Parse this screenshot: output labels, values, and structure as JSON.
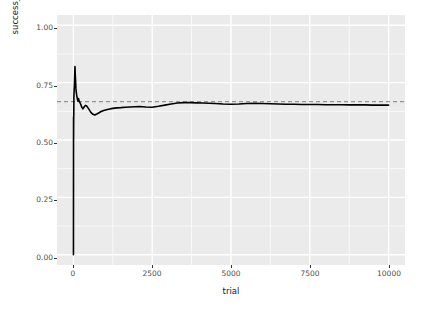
{
  "chart_data": {
    "type": "line",
    "title": "",
    "subtitle": "",
    "xlabel": "trial",
    "ylabel": "success_rate",
    "xlim": [
      -520,
      10520
    ],
    "ylim": [
      -0.045,
      1.045
    ],
    "grid": true,
    "grid_color": "#ffffff",
    "panel_background": "#ebebeb",
    "legend": null,
    "legend_position": "none",
    "xticks": [
      0,
      2500,
      5000,
      7500,
      10000
    ],
    "xtick_labels": [
      "0",
      "2500",
      "5000",
      "7500",
      "10000"
    ],
    "xticks_minor": [
      1250,
      3750,
      6250,
      8750
    ],
    "yticks": [
      0.0,
      0.25,
      0.5,
      0.75,
      1.0
    ],
    "ytick_labels": [
      "0.00",
      "0.25",
      "0.50",
      "0.75",
      "1.00"
    ],
    "yticks_minor": [
      0.125,
      0.375,
      0.625,
      0.875
    ],
    "series": [
      {
        "name": "success_rate",
        "type": "line",
        "color": "#000000",
        "linewidth": 1.6,
        "linestyle": "solid",
        "x": [
          1,
          2,
          3,
          4,
          5,
          6,
          8,
          10,
          13,
          16,
          20,
          25,
          30,
          36,
          43,
          50,
          60,
          70,
          80,
          90,
          100,
          115,
          130,
          145,
          160,
          180,
          200,
          225,
          250,
          275,
          300,
          340,
          380,
          420,
          470,
          520,
          570,
          620,
          680,
          740,
          800,
          880,
          960,
          1050,
          1150,
          1250,
          1380,
          1500,
          1650,
          1800,
          1950,
          2100,
          2300,
          2500,
          2700,
          2900,
          3100,
          3300,
          3500,
          3700,
          3900,
          4100,
          4300,
          4500,
          4750,
          5000,
          5250,
          5500,
          5750,
          6000,
          6250,
          6500,
          6750,
          7000,
          7250,
          7500,
          7750,
          8000,
          8250,
          8500,
          8750,
          9000,
          9250,
          9500,
          9750,
          10000
        ],
        "y": [
          0.0,
          0.0,
          0.333,
          0.5,
          0.6,
          0.5,
          0.571,
          0.6,
          0.615,
          0.688,
          0.7,
          0.72,
          0.733,
          0.75,
          0.791,
          0.82,
          0.783,
          0.757,
          0.725,
          0.711,
          0.7,
          0.687,
          0.677,
          0.669,
          0.681,
          0.672,
          0.665,
          0.658,
          0.649,
          0.641,
          0.636,
          0.644,
          0.651,
          0.648,
          0.639,
          0.628,
          0.618,
          0.612,
          0.609,
          0.613,
          0.618,
          0.624,
          0.629,
          0.632,
          0.635,
          0.638,
          0.64,
          0.641,
          0.643,
          0.644,
          0.645,
          0.646,
          0.644,
          0.643,
          0.647,
          0.652,
          0.657,
          0.661,
          0.663,
          0.663,
          0.662,
          0.661,
          0.66,
          0.659,
          0.657,
          0.656,
          0.657,
          0.659,
          0.66,
          0.659,
          0.658,
          0.657,
          0.656,
          0.656,
          0.655,
          0.655,
          0.655,
          0.654,
          0.654,
          0.654,
          0.653,
          0.653,
          0.653,
          0.652,
          0.652,
          0.652
        ]
      },
      {
        "name": "reference",
        "type": "hline",
        "color": "#808080",
        "linewidth": 1.0,
        "linestyle": "dashed",
        "value": 0.667,
        "x_start": -520,
        "x_end": 10520
      }
    ]
  },
  "axes": {
    "y_title": "success_rate",
    "x_title": "trial"
  }
}
